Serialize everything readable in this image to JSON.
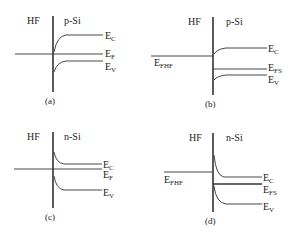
{
  "figure": {
    "panels": [
      {
        "id": "a",
        "caption": "(a)",
        "left_label": "HF",
        "right_label": "p-Si",
        "levels": [
          {
            "sym": "E",
            "sub": "C"
          },
          {
            "sym": "E",
            "sub": "F"
          },
          {
            "sym": "E",
            "sub": "V"
          }
        ]
      },
      {
        "id": "b",
        "caption": "(b)",
        "left_label": "HF",
        "right_label": "p-Si",
        "left_level": {
          "sym": "E",
          "sub": "FHF"
        },
        "levels": [
          {
            "sym": "E",
            "sub": "C"
          },
          {
            "sym": "E",
            "sub": "FS"
          },
          {
            "sym": "E",
            "sub": "V"
          }
        ]
      },
      {
        "id": "c",
        "caption": "(c)",
        "left_label": "HF",
        "right_label": "n-Si",
        "levels": [
          {
            "sym": "E",
            "sub": "C"
          },
          {
            "sym": "E",
            "sub": "F"
          },
          {
            "sym": "E",
            "sub": "V"
          }
        ]
      },
      {
        "id": "d",
        "caption": "(d)",
        "left_label": "HF",
        "right_label": "n-Si",
        "left_level": {
          "sym": "E",
          "sub": "FHF"
        },
        "levels": [
          {
            "sym": "E",
            "sub": "C"
          },
          {
            "sym": "E",
            "sub": "FS"
          },
          {
            "sym": "E",
            "sub": "V"
          }
        ]
      }
    ]
  }
}
